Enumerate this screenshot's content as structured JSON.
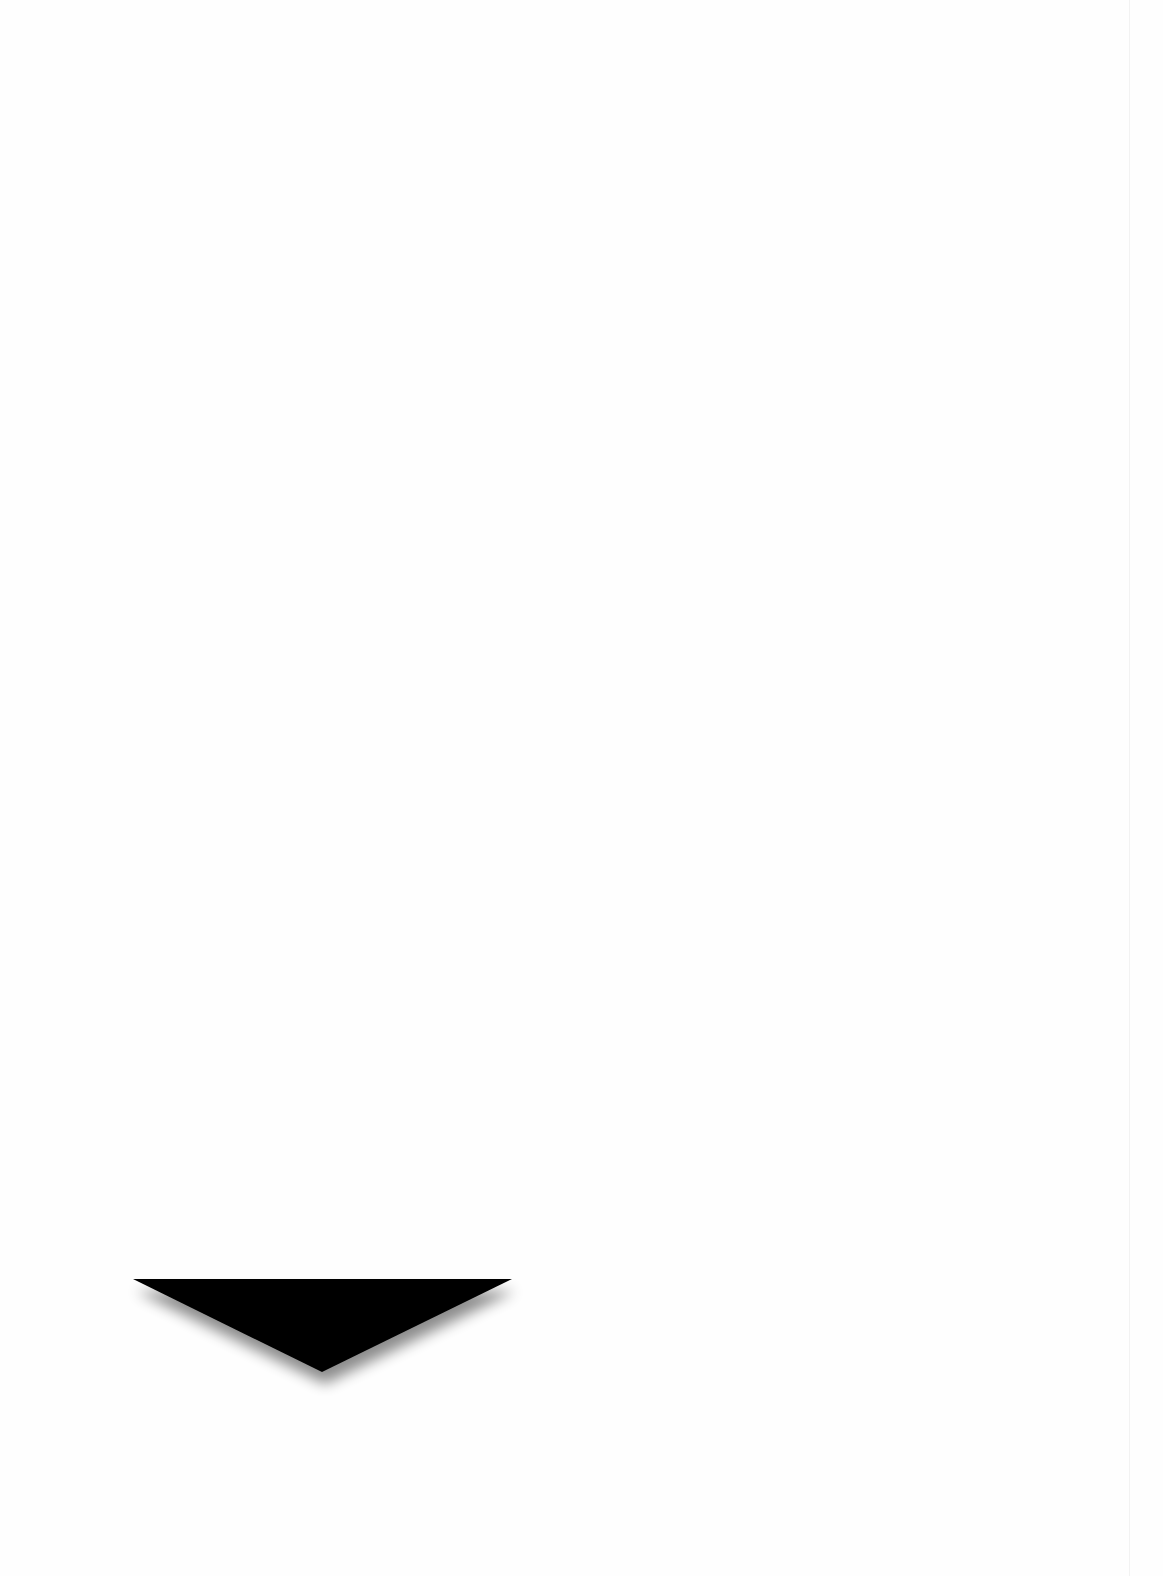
{
  "page": {
    "background": "#fefefe",
    "edge_line_color": "#f2f2f2"
  },
  "arrow": {
    "icon": "down-triangle-icon",
    "direction": "down",
    "fill": "#000000",
    "shadow_color": "#9a9a9a",
    "points": {
      "top_left": [
        133,
        1279
      ],
      "top_right": [
        512,
        1279
      ],
      "apex": [
        322,
        1372
      ]
    }
  }
}
